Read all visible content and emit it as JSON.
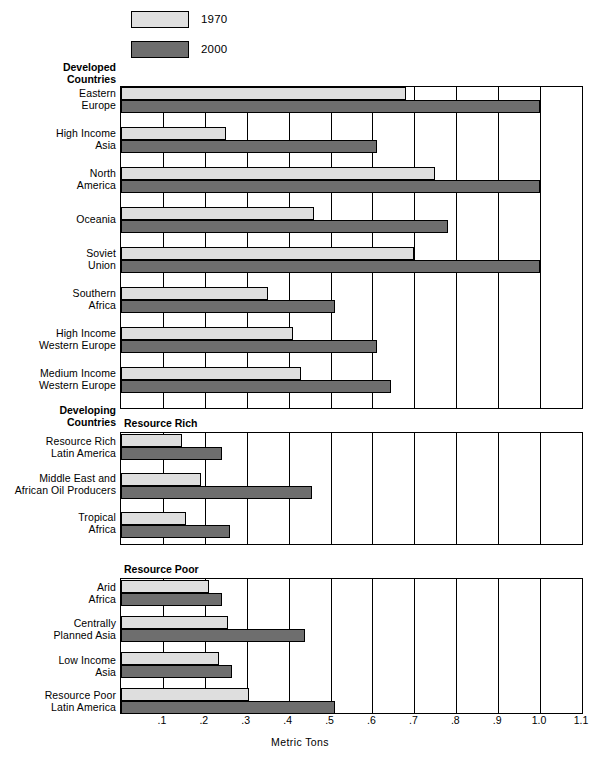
{
  "legend": {
    "items": [
      {
        "label": "1970",
        "color": "#dedede",
        "name": "legend-1970"
      },
      {
        "label": "2000",
        "color": "#6e6e6e",
        "name": "legend-2000"
      }
    ]
  },
  "sections": {
    "developed": {
      "line1": "Developed",
      "line2": "Countries"
    },
    "developing": {
      "line1": "Developing",
      "line2": "Countries"
    },
    "resource_rich": "Resource Rich",
    "resource_poor": "Resource Poor"
  },
  "axis": {
    "title": "Metric Tons",
    "ticks": [
      ".1",
      ".2",
      ".3",
      ".4",
      ".5",
      ".6",
      ".7",
      ".8",
      ".9",
      "1.0",
      "1.1"
    ],
    "tick_values": [
      0.1,
      0.2,
      0.3,
      0.4,
      0.5,
      0.6,
      0.7,
      0.8,
      0.9,
      1.0,
      1.1
    ],
    "min": 0.0,
    "max": 1.1
  },
  "chart_data": {
    "type": "bar",
    "orientation": "horizontal",
    "title": "",
    "xlabel": "Metric Tons",
    "ylabel": "",
    "xlim": [
      0.0,
      1.1
    ],
    "grid": true,
    "legend_position": "top",
    "series": [
      {
        "name": "1970",
        "color": "#dedede"
      },
      {
        "name": "2000",
        "color": "#6e6e6e"
      }
    ],
    "groups": [
      {
        "group": "Developed Countries",
        "categories": [
          "Eastern Europe",
          "High Income Asia",
          "North America",
          "Oceania",
          "Soviet Union",
          "Southern Africa",
          "High Income Western Europe",
          "Medium Income Western Europe"
        ],
        "values_1970": [
          0.68,
          0.25,
          0.75,
          0.46,
          0.7,
          0.35,
          0.41,
          0.43
        ],
        "values_2000": [
          1.0,
          0.61,
          1.0,
          0.78,
          1.0,
          0.51,
          0.61,
          0.645
        ]
      },
      {
        "group": "Developing Countries - Resource Rich",
        "categories": [
          "Resource Rich Latin America",
          "Middle East and African Oil Producers",
          "Tropical Africa"
        ],
        "values_1970": [
          0.145,
          0.19,
          0.155
        ],
        "values_2000": [
          0.24,
          0.455,
          0.26
        ]
      },
      {
        "group": "Developing Countries - Resource Poor",
        "categories": [
          "Arid Africa",
          "Centrally Planned Asia",
          "Low Income Asia",
          "Resource Poor Latin America"
        ],
        "values_1970": [
          0.21,
          0.255,
          0.235,
          0.305
        ],
        "values_2000": [
          0.24,
          0.44,
          0.265,
          0.51
        ]
      }
    ]
  },
  "row_labels": {
    "eastern_europe": [
      "Eastern",
      "Europe"
    ],
    "high_income_asia": [
      "High Income",
      "Asia"
    ],
    "north_america": [
      "North",
      "America"
    ],
    "oceania": [
      "Oceania",
      ""
    ],
    "soviet_union": [
      "Soviet",
      "Union"
    ],
    "southern_africa": [
      "Southern",
      "Africa"
    ],
    "high_income_western_europe": [
      "High Income",
      "Western Europe"
    ],
    "medium_income_western_europe": [
      "Medium Income",
      "Western Europe"
    ],
    "resource_rich_latin_america": [
      "Resource Rich",
      "Latin America"
    ],
    "middle_east_african_oil": [
      "Middle East and",
      "African Oil Producers"
    ],
    "tropical_africa": [
      "Tropical",
      "Africa"
    ],
    "arid_africa": [
      "Arid",
      "Africa"
    ],
    "centrally_planned_asia": [
      "Centrally",
      "Planned Asia"
    ],
    "low_income_asia": [
      "Low Income",
      "Asia"
    ],
    "resource_poor_latin_america": [
      "Resource Poor",
      "Latin America"
    ]
  }
}
